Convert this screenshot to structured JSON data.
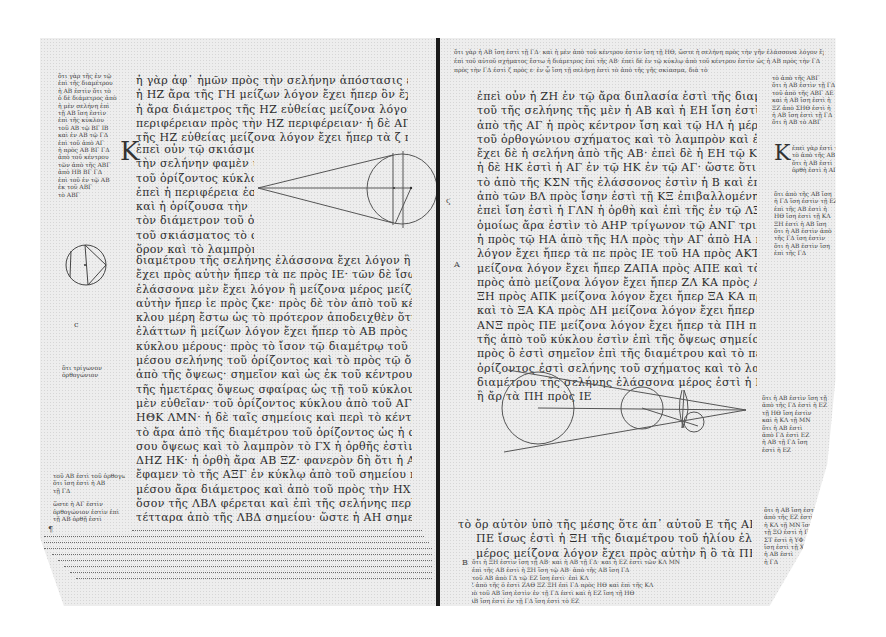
{
  "document": {
    "type": "manuscript-photograph",
    "description": "Open codex spread, Greek minuscule text with geometric diagrams and marginal scholia",
    "colors": {
      "parchment": "#ededed",
      "ink": "#2c2c2c",
      "spine": "#1a1a1a",
      "background": "#ffffff"
    }
  },
  "left_page": {
    "main_text_top": [
      "ἡ γὰρ ἀφ᾽ ἡμῶν πρὸς τὴν σελήνην ἀπόστασις ἐλάσσων ἐστὶν ἢ ὀκτωκαιδεκαπλασίων",
      "ἡ ΗΖ ἄρα τῆς ΓΗ μείζων λόγον ἔχει ἤπερ ὃν ἔχει τὰ ζ πρὸς ε",
      "ἡ ἄρα διάμετρος τῆς ΗΖ εὐθείας μείζονα λόγον ἔχει ἤπερ ὃν ΑΓ πρὸς",
      "περιφέρειαν πρὸς τὴν ΗΖ περιφέρειαν· ἡ δὲ ΑΓ ἴση ἐστὶ τῇ εὐθείᾳ",
      "τῆς ΗΖ εὐθείας μείζονα λόγον ἔχει ἤπερ τὰ ζ πρὸς ε"
    ],
    "initial_letter": "Κ",
    "main_text_beside_diagram": [
      "ἐπεὶ οὖν τῷ σκιάσματι",
      "τὴν σελήνην φαμὲν ὑπὸ",
      "τοῦ ὁρίζοντος κύκλου",
      "ἐπεὶ ἡ περιφέρεια ἐστὶν",
      "καὶ ἡ ὁρίζουσα τὴν",
      "τὸν διάμετρον τοῦ ὁρίζον",
      "τοῦ σκιάσματος τὸ σχῆμα",
      "ὅρον καὶ τὸ λαμπρὸν τῆς"
    ],
    "main_text_bottom": [
      "διαμέτρου τῆς σελήνης ἐλάσσονα ἔχει λόγον ἢ ὃν μείζονα λόγον",
      "ἔχει πρὸς αὐτὴν ἤπερ τὰ πε πρὸς ΙΕ· τῶν δὲ ἴσων ἐστὶ διαμέτρων",
      "ἐλάσσονα μὲν ἔχει λόγον ἢ μείζονα μέρος μείζονα λόγον ἔχει πρὸς",
      "αὐτὴν ἤπερ ἰε πρὸς ζκε· πρὸς δὲ τὸν ἀπὸ τοῦ κέντρου τοῦ κύ",
      "κλου μέρη ἔστω ὡς τὸ πρότερον ἀποδειχθὲν ὅτι ἐστὶ τὸ πλάτος",
      "ἐλάττων ἢ μείζων λόγον ἔχει ἤπερ τὸ ΑΒ πρὸς τὸ ΒΓ· ἀλλ᾽ ἡ",
      "κύκλου μέρους· πρὸς τὸ ἴσον τῷ διαμέτρῳ τοῦ ἐπὶ σελήνης διά",
      "μέσου σελήνης τοῦ ὁρίζοντος καὶ τὸ πρὸς τῷ ὄμματι αὐτῆς ἀπὸ",
      "ἀπὸ τῆς ὄψεως· σημεῖον καὶ ὡς ἐκ τοῦ κέντρου ΑΒΓ ὑποτεινούσης",
      "τῆς ἡμετέρας ὄψεως σφαίρας ὡς τῇ τοῦ κύκλου ἐκ τοῦ ὄμματος",
      "μὲν εὐθεῖαν· τοῦ ὁρίζοντος κύκλου ἀπὸ τοῦ ΑΓ ἴση μέρει τῶν ΑΞΖ",
      "ΗΘΚ ΛΜΝ· ἡ δὲ ταῖς σημείοις καὶ περὶ τὸ κέντρον τὸ πρὸς",
      "τὸ ἄρα ἀπὸ τῆς διαμέτρου τοῦ ὁρίζοντος ὡς ἡ σελήνη τοῦ τό",
      "σου ὄψεως καὶ τὸ λαμπρὸν τὸ ΓΧ ἡ ὀρθῆς ἐστὶν ἴσων εὐθεῖα",
      "ΔΗΖ ΗΚ· ἡ ὀρθὴ ἄρα ΑΒ ΞΖ· φανερὸν δὴ ὅτι ἡ ΑΞΓ οὕτως",
      "ἔφαμεν τὸ τῆς ΑΞΓ ἐν κύκλῳ ἀπὸ τοῦ σημείου περὶ τοῦ",
      "μέσου ἄρα διάμετρος καὶ ἀπὸ τοῦ πρὸς τὴν ΗΧ περιφέρειαν",
      "ὅσον τῆς ΛΒΛ φέρεται καὶ ἐπὶ τῆς σελήνης περὶ τοῦ ὄμματος",
      "τέτταρα ἀπὸ τῆς ΛΒΔ σημείου· ὥστε ἡ ΑΗ σημεῖον ὀρθῶν"
    ],
    "margin_scholia_top": [
      "ὅτι γὰρ τῆς ἐν τῷ",
      "ἐπὶ τῆς διαμέτρου",
      "ἡ ΑΒ ἐστὶν ὅτι τὸ",
      "ὁ δὲ διάμετρος ἀπὸ",
      "ἡ μὲν σελήνη ἐπὶ",
      "τῇ ΑΒ ἴση ἐστὶν",
      "ἐπὶ τῆς κύκλου",
      "τοῦ ΑΒ τῷ ΒΓ ΙΒ",
      "καὶ ἐν ΑΒ τῷ ΓΔ",
      "ἐπὶ τοῦ ἀπὸ ΑΓ",
      "ἡ πρὸς ΑΒ ΒΓ ΓΔ",
      "ἀπὸ τοῦ κέντρου",
      "τῶν ἀπὸ τῆς ΑΒΓ",
      "ἀπὸ ΗΒ ΒΓ ΓΔ",
      "ἐπὶ τοῦ ἐν τῷ ΑΒ",
      "ἐκ τοῦ ΑΒΓ",
      "τὸ ΑΒΓ"
    ],
    "margin_scholia_middle": [
      "ὅτι τρίγωνον",
      "ὀρθογώνιον"
    ],
    "margin_scholia_lower": [
      "τοῦ ΑΒ ἐστὶ τοῦ ὀρθογωνίου",
      "ὅτι ἴση ἐστὶ ἡ ΑΒ",
      "τῇ ΓΔ",
      "ὥστε ἡ ΑΓ ἐστὶν",
      "ὀρθογώνιον ἐστὶν ἐπὶ",
      "τῇ ΑΒ ὀρθῇ ἐστὶ"
    ],
    "footer_scholia_lines": 9,
    "margin_marks": [
      "c",
      "¶"
    ]
  },
  "right_page": {
    "header_scholia": [
      "ὅτι γὰρ ἡ ΑΒ ἴση ἐστὶ τῇ ΓΔ· καὶ ἡ μὲν ἀπὸ τοῦ κέντρου ἐστὶν ἴση τῇ ΗΘ, ὥστε ἡ σελήνη πρὸς τὴν γῆν ἐλάσσονα λόγον ἔχει",
      "ἐπὶ τοῦ αὐτοῦ σχήματος ἔστω ἡ διάμετρος ἐπὶ τῆς ΑΒ· ἐπεὶ δὲ ἐν τῷ κύκλῳ ἀπὸ τοῦ κέντρου ἐστὶν ὡς ἡ ΑΒ πρὸς τὴν ΓΔ",
      "πρὸς τὴν ΓΔ ἐστὶ ζ πρὸς ε· ἐν ᾧ ἴση τῇ σελήνῃ ἐστὶ τὸ ἀπὸ τῆς γῆς σκίασμα, διὰ τὸ"
    ],
    "main_text_top": [
      "ἐπεὶ οὖν ἡ ΖΗ ἐν τῷ ἄρα διπλασία ἐστὶ τῆς διαμέτρου τοῦ ὁρίζοντος ὀρθῆς",
      "τοῦ τῆς σελήνης τῆς μὲν ἡ ΑΒ καὶ ἡ ΕΗ ἴση ἐστὶ τῷ ΕΚΛ ΚΖΘ",
      "ἀπὸ τῆς ΑΓ ἡ πρὸς κέντρον ἴση καὶ τῷ ΗΛ ἡ μέρει τοῦ ὁρίζοντος",
      "τοῦ ὀρθογώνιου σχήματος καὶ τὸ λαμπρὸν καὶ ἐπὶ τῆς ΕΗ ΖΘ",
      "ἔχει δὲ ἡ σελήνη ἀπὸ τῆς ΑΒ· ἐπεὶ δὲ ἡ ΕΗ τῷ ΚΛ ἐλάσσων ἐστὶν",
      "ἡ δὲ ΗΚ ἐστὶ ἡ ΑΓ ἐν τῷ ΗΚ ἐν τῷ ΑΓ· ὥστε ὅτι",
      "τὸ ἀπὸ τῆς ΚΣΝ τῆς ἐλάσσονος ἐστὶν ἡ Β καὶ ἐπεὶ ἡ ΚΛ ἐλάσσων ἐστὶ",
      "ἀπὸ τῶν ΒΛ πρὸς ἴσην ἐστὶ τῇ ΚΞ ἐπιβαλλομένη ἡ ΛΝΠ· ἄρα",
      "ἐπεὶ ἴση ἐστὶ ἡ ΓΛΝ ἡ ὀρθὴ καὶ ἐπὶ τῆς ἐν τῷ ΛΞ ΑΓ τῷ ΓΗ",
      "ὁμοίως ἄρα ἐστὶν τὸ ΑΗΡ τρίγωνον τῷ ΑΝΓ τριγώνῳ ἐστὶν ὀρθή",
      "ἡ πρὸς τῷ ΗΑ ἀπὸ τῆς ΗΛ πρὸς τὴν ΑΓ ἀπὸ ΗΑ πρὸς τὴν ΑΓ μείζων",
      "λόγον ἔχει ἤπερ τὰ πε πρὸς ΙΕ τοῦ ΗΑ πρὸς ΑΚΤ",
      "μείζονα λόγον ἔχει ἤπερ ΖΑΠΑ πρὸς ΑΠΕ καὶ τὰ ἀπὸ ΞΜ ὅρα",
      "πρὸς ἀπὸ μείζονα λόγον ἔχει ἤπερ ΖΛ ΚΑ πρὸς ΑΠΕ καὶ",
      "ΞΗ πρὸς ΑΠΚ μείζονα λόγον ἔχει ἤπερ ΞΑ ΚΑ πρὸς ΑΗ ἕχει",
      "καὶ τὸ ΞΑ ΚΑ πρὸς ΔΗ μείζονα λόγον ἔχει ἤπερ τὰ ΠΗ πρὸς ΙΕ ἄρα",
      "ΑΝΞ πρὸς ΠΕ μείζονα λόγον ἔχει ἤπερ τὰ ΠΗ πρὸς ΑΞ καὶ ἄρα",
      "τῆς ἀπὸ τοῦ κύκλου ἐστὶν ἐπὶ τῆς ὄψεως σημείου ἀπὸ τοῦ",
      "πρὸς ὃ ἐστὶ σημεῖον ἐπὶ τῆς διαμέτρου καὶ τὸ περὶ τοῦ μέρους τοῦ",
      "ὁρίζοντος ἐστὶ σελήνης τοῦ σχήματος καὶ τὸ λαμπρὸν τῆς",
      "διαμέτρου τῆς σελήνης ἐλάσσονα μέρος ἐστὶ ἡ Β μείζονα λόγον ἔχει",
      "ἢ ἄρ τὰ ΠΗ πρὸς ΙΕ"
    ],
    "main_text_after_diagram": [
      "τὸ ὄρ αὐτὸν ὑπὸ τῆς μέσης ὅτε ἀπ᾽ αὐτοῦ Ε τῆς ΑΒ πρὸς ὀρθὰς ἡ",
      "ΠΕ ἴσως ἐστὶ ἡ ΞΗ τῆς διαμέτρου τοῦ ἡλίου ἐλάσσων μέν ἐστιν ἢ ὁ",
      "μέρος μείζονα λόγον ἔχει πρὸς αὐτὴν ἢ ὃ τὰ ΠΗ πρὸς ΙΕ"
    ],
    "footer_scholia": [
      "ὅτι ἡ ΞΗ ἐστὶν ἴση τῇ ΑΒ· καὶ ἡ ΑΒ τῇ ΓΔ· καὶ ἡ ΕΖ ἐστὶ τῶν ΚΛ ΜΝ",
      "ἐπὶ τῆς ΑΒ ἐστὶ ἡ ΞΗ ἴση τῷ ΑΒ· ἀπὸ τῆς ΑΒ ἴση ΓΔ",
      "τοῦ ΑΒ ἀπὸ ΓΔ τῷ ΕΖ ἴση ἐστὶ· ἐπὶ ΚΛ",
      "ΝΞΖ ἀπὸ τῆς ὁ ἐστὶ ΖΑΘ ΞΖ ΞΗ ἐπὶ ΓΔ πρὸς ΗΘ καὶ ἐπὶ τῆς ΚΛ",
      "ἡ ἀπὸ τοῦ ΑΒ ἴση ἐστὶν ἐν τῇ ΓΔ ἐστὶ καὶ ἡ ΕΖ ἴση τῇ ΗΘ",
      "ἡ ΑΒ ἴση ἐστὶ ἐν τῇ ΓΔ ἴση ἐστὶ τὸ ΕΖ"
    ],
    "margin_scholia_top": [
      "τὸ ἀπὸ τῆς ΑΒΓ",
      "ὅτι ἡ ΑΒ ἐστὶν τῇ ΓΔ",
      "τοῦ ἀπὸ τῆς ΑΒΓ ΔΕ",
      "καὶ ἡ ΑΒ ἴση ἐστὶ ἡ",
      "ΞΖ ἀπὸ ΣΗΘ ἐστὶ ἡ",
      "ἡ ΑΒ ἴση ἐστὶ τῇ ΓΔ",
      "ὅτι ἡ ΑΒ τὸ ΑΒΓ"
    ],
    "margin_initial": "Κ",
    "margin_initial_text": [
      "ἐπεὶ γὰρ ἐστὶ τῇ",
      "τὸ ἀπὸ τῆς ΑΒ",
      "ὅτι ἡ ΑΒ ἐστὶ",
      "ὀρθὴ ἐστὶ ἡ ΑΓ"
    ],
    "margin_scholia_middle": [
      "ὅτι ἀπὸ τῆς ΑΒ ἴση",
      "ἡ ΓΔ ἴση ἐστὶν τῇ ΕΖ",
      "ἐπὶ τῆς ΑΒ ἐστὶ ἡ",
      "ΗΘ ἴση ἐστὶ τῇ ΚΛ",
      "ΞΗ ἐστὶ ἡ ΑΒ ἴση",
      "ὅτι ἡ ΑΒ ἐστὶν ἀπὸ",
      "τῆς ΓΔ ἴση ἐστὶν",
      "ὅτι ἡ ΑΒ ἐστὶν ἴση",
      "ἐπὶ τῆς ΓΔ"
    ],
    "margin_scholia_lower": [
      "ὅτι ἡ ΑΒ ἐστὶν ἴση τῇ",
      "ἀπὸ τῆς ΓΔ ἐστὶ ἡ ΕΖ",
      "τῇ ΗΘ ἴση ἐστὶν",
      "καὶ ἡ ΚΛ τῇ ΜΝ",
      "ὅτι ἡ ΑΒ ἐστὶ",
      "ἀπὸ ΓΔ ἐστὶ ΕΖ",
      "ἡ ΑΒ τῇ ΓΔ ἴση",
      "ἐστὶ ἡ ΕΖ"
    ],
    "margin_scholia_bottom": [
      "ὅτι ἡ ΑΒ ἴση ἐστὶ τῇ ΓΔ",
      "ἀπὸ τῆς ΕΖ ἐστὶ ἡ ΗΘ",
      "ἡ ΚΛ τῇ ΜΝ ἴση",
      "τῇ ΞΟ ἐστὶ ἡ ΠΡ",
      "ΣΤ ἐστὶ ἡ ΥΦ",
      "ἴση ἐστὶ τῇ ΧΨ",
      "ἡ ΑΒ ἐστὶ",
      "ἡ ΓΔ"
    ],
    "margin_marks": [
      "ϛ",
      "Α",
      "Β"
    ]
  },
  "diagrams": [
    {
      "name": "tangent-cone-circle",
      "page": "left",
      "description": "Circle with two tangent lines converging to a point on the left, with vertical chords and a diameter"
    },
    {
      "name": "inscribed-triangle-circle",
      "page": "left-margin",
      "description": "Small circle with inscribed chords forming a triangle and a line"
    },
    {
      "name": "sun-earth-moon-cone",
      "page": "right",
      "description": "Large circle, medium circle, and small circle aligned along an axis with two tangent lines converging to a point on the right"
    }
  ]
}
